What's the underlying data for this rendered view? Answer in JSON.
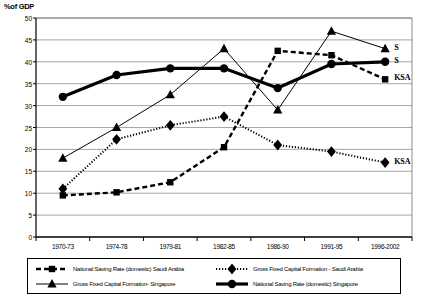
{
  "chart_data": {
    "type": "line",
    "title": "",
    "xlabel": "",
    "ylabel": "%of GDP",
    "ylim": [
      0,
      50
    ],
    "ytick_step": 5,
    "grid": true,
    "legend_position": "bottom",
    "categories": [
      "1970-73",
      "1974-78",
      "1979-81",
      "1982-85",
      "1986-90",
      "1991-95",
      "1996-2002"
    ],
    "yticks": [
      "0",
      "5",
      "10",
      "15",
      "20",
      "25",
      "30",
      "35",
      "40",
      "45",
      "50"
    ],
    "series": [
      {
        "name": "National Saving Rate (domestic) Saudi Arabia",
        "key": "nsr_ksa",
        "marker": "square",
        "line": "dashed",
        "color": "#000000",
        "values": [
          9.5,
          10.2,
          12.5,
          20.5,
          42.5,
          41.5,
          36.0
        ],
        "end_label": "KSA"
      },
      {
        "name": "Gross Fixed Capital Formation- Singapore",
        "key": "gfcf_sg",
        "marker": "triangle",
        "line": "solid-thin",
        "color": "#000000",
        "values": [
          18.0,
          25.0,
          32.5,
          43.0,
          29.0,
          47.0,
          43.0
        ],
        "end_label": "S"
      },
      {
        "name": "Gross Fixed Capital Formation - Saudi Arabia",
        "key": "gfcf_ksa",
        "marker": "diamond",
        "line": "dotted",
        "color": "#000000",
        "values": [
          11.0,
          22.3,
          25.5,
          27.5,
          21.0,
          19.5,
          17.0
        ],
        "end_label": "KSA"
      },
      {
        "name": "National Saving Rate (domestic) Singapore",
        "key": "nsr_sg",
        "marker": "circle",
        "line": "solid-thick",
        "color": "#000000",
        "values": [
          32.0,
          37.0,
          38.5,
          38.5,
          34.0,
          39.5,
          40.0
        ],
        "end_label": "S"
      }
    ],
    "annotations": [
      {
        "text": "S",
        "series": "gfcf_sg",
        "at": "1996-2002"
      },
      {
        "text": "S",
        "series": "nsr_sg",
        "at": "1996-2002"
      },
      {
        "text": "KSA",
        "series": "nsr_ksa",
        "at": "1996-2002"
      },
      {
        "text": "KSA",
        "series": "gfcf_ksa",
        "at": "1996-2002"
      }
    ]
  },
  "legend": {
    "items": [
      {
        "label": "National Saving Rate (domestic) Saudi Arabia",
        "key": "nsr_ksa"
      },
      {
        "label": "Gross Fixed Capital Formation- Singapore",
        "key": "gfcf_sg"
      },
      {
        "label": "Gross Fixed Capital Formation - Saudi Arabia",
        "key": "gfcf_ksa"
      },
      {
        "label": "National Saving Rate (domestic) Singapore",
        "key": "nsr_sg"
      }
    ]
  }
}
